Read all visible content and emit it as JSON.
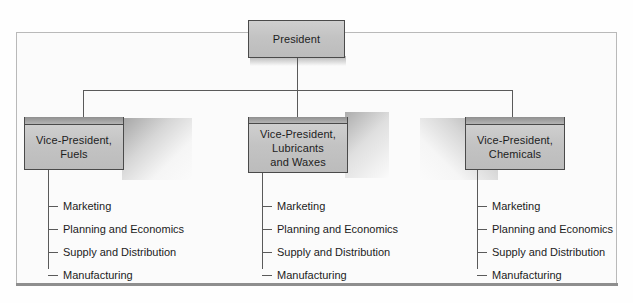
{
  "chart": {
    "type": "org-chart",
    "title": "",
    "root": {
      "label": "President"
    },
    "divisions": [
      {
        "label_lines": [
          "Vice-President,",
          "Fuels"
        ],
        "label": "Vice-President, Fuels",
        "functions": [
          "Marketing",
          "Planning and Economics",
          "Supply and Distribution",
          "Manufacturing"
        ]
      },
      {
        "label_lines": [
          "Vice-President,",
          "Lubricants",
          "and Waxes"
        ],
        "label": "Vice-President, Lubricants and Waxes",
        "functions": [
          "Marketing",
          "Planning and Economics",
          "Supply and Distribution",
          "Manufacturing"
        ]
      },
      {
        "label_lines": [
          "Vice-President,",
          "Chemicals"
        ],
        "label": "Vice-President, Chemicals",
        "functions": [
          "Marketing",
          "Planning and Economics",
          "Supply and Distribution",
          "Manufacturing"
        ]
      }
    ],
    "colors": {
      "box_fill": "#c3c3c3",
      "box_border": "#4a4a4a",
      "line": "#5a5a5a",
      "frame_border": "#b9b9b9",
      "frame_bottom": "#8e8e8e",
      "background": "#fbfbfb",
      "text": "#1d1d1d"
    }
  }
}
